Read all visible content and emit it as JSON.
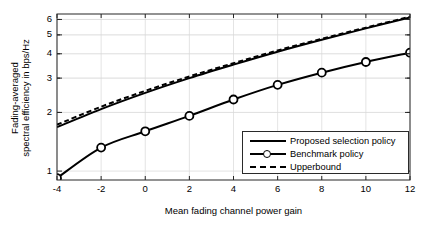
{
  "chart_data": {
    "type": "line",
    "title": "",
    "xlabel": "Mean fading channel power gain",
    "ylabel": "Fading-averaged spectral efficiency in bps/Hz",
    "ylabel_lines": [
      "Fading-averaged",
      "spectral efficiency in bps/Hz"
    ],
    "yscale": "log",
    "xscale": "linear",
    "xlim": [
      -4,
      12
    ],
    "ylim": [
      0.9,
      6.4
    ],
    "grid": true,
    "legend_position": "lower right",
    "xticks": [
      -4,
      -2,
      0,
      2,
      4,
      6,
      8,
      10,
      12
    ],
    "xticklabels": [
      "-4",
      "-2",
      "0",
      "2",
      "4",
      "6",
      "8",
      "10",
      "12"
    ],
    "yticks": [
      1,
      2,
      3,
      4,
      5,
      6
    ],
    "yticklabels": [
      "1",
      "2",
      "3",
      "4",
      "5",
      "6"
    ],
    "x": [
      -4,
      -2,
      0,
      2,
      4,
      6,
      8,
      10,
      12
    ],
    "series": [
      {
        "name": "Proposed selection policy",
        "style": "solid",
        "marker": "none",
        "color": "#000000",
        "values": [
          1.68,
          2.08,
          2.52,
          3.0,
          3.52,
          4.1,
          4.72,
          5.4,
          6.15
        ]
      },
      {
        "name": "Benchmark policy",
        "style": "solid",
        "marker": "circle",
        "color": "#000000",
        "values": [
          0.92,
          1.32,
          1.6,
          1.92,
          2.33,
          2.77,
          3.2,
          3.63,
          4.05
        ]
      },
      {
        "name": "Upperbound",
        "style": "dashed",
        "marker": "none",
        "color": "#000000",
        "values": [
          1.73,
          2.14,
          2.58,
          3.06,
          3.58,
          4.16,
          4.78,
          5.45,
          6.2
        ]
      }
    ]
  }
}
